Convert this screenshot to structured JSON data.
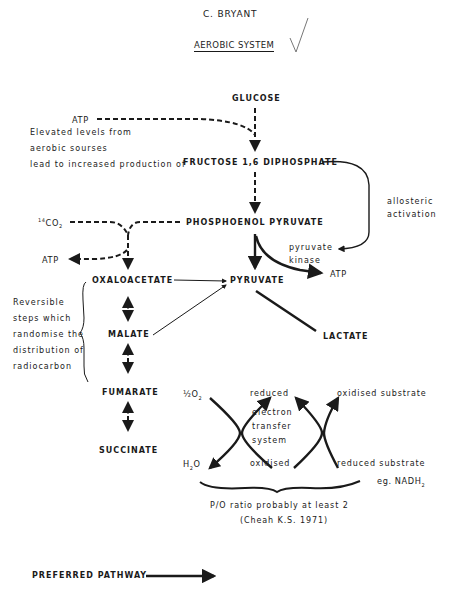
{
  "header": {
    "author": "C. BRYANT",
    "title": "AEROBIC SYSTEM",
    "checkmark": "check-mark-icon"
  },
  "nodes": {
    "glucose": "GLUCOSE",
    "fructose": "FRUCTOSE 1,6 DIPHOSPHATE",
    "pep": "PHOSPHOENOL PYRUVATE",
    "pyruvate": "PYRUVATE",
    "oxaloacetate": "OXALOACETATE",
    "malate": "MALATE",
    "fumarate": "FUMARATE",
    "succinate": "SUCCINATE",
    "lactate": "LACTATE",
    "atp_top": "ATP",
    "atp_left": "ATP",
    "atp_right": "ATP",
    "co2_prefix": "14",
    "co2": "CO",
    "co2_sub": "2"
  },
  "annotations": {
    "elevated_line1": "Elevated levels from",
    "elevated_line2": "aerobic sourses",
    "elevated_line3": "lead to increased production of",
    "allosteric_line1": "allosteric",
    "allosteric_line2": "activation",
    "pk_line1": "pyruvate",
    "pk_line2": "kinase",
    "reversible": [
      "Reversible",
      "steps which",
      "randomise the",
      "distribution of",
      "radiocarbon"
    ]
  },
  "electron_transfer": {
    "half_o2": "½O",
    "half_o2_sub": "2",
    "h2o_h": "H",
    "h2o_sub": "2",
    "h2o_o": "O",
    "reduced": "reduced",
    "oxidised": "oxidised",
    "ets_line1": "electron",
    "ets_line2": "transfer",
    "ets_line3": "system",
    "oxidised_substrate": "oxidised substrate",
    "reduced_substrate": "reduced substrate",
    "nadh": "eg. NADH",
    "nadh_sub": "2"
  },
  "footer": {
    "po_ratio": "P/O ratio probably at least 2",
    "citation": "(Cheah K.S. 1971)",
    "legend_label": "PREFERRED PATHWAY"
  }
}
